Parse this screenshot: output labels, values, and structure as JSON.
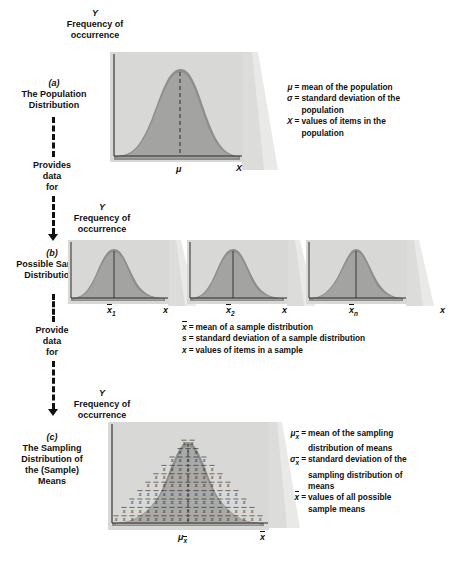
{
  "figure": {
    "background": "#ffffff",
    "panel_fill": "#d8d8d6",
    "curve_band": "#8e8e8c",
    "curve_fill": "#a6a6a4"
  },
  "axis_label": {
    "y_symbol": "Y",
    "y_line1": "Frequency of",
    "y_line2": "occurrence"
  },
  "flow": {
    "step1_line1": "Provides",
    "step1_line2": "data",
    "step1_line3": "for",
    "step2_line1": "Provide",
    "step2_line2": "data",
    "step2_line3": "for"
  },
  "panels": [
    {
      "id": "a",
      "tag": "(a)",
      "caption_lines": [
        "The Population",
        "Distribution"
      ],
      "x_axis_label": "X",
      "center_tick": "μ",
      "curve_type": "right-skewed",
      "center_line_style": "dashed",
      "legend": [
        {
          "symbol": "μ",
          "desc_lines": [
            "mean of the population"
          ]
        },
        {
          "symbol": "σ",
          "desc_lines": [
            "standard deviation of the",
            "population"
          ]
        },
        {
          "symbol": "X",
          "desc_lines": [
            "values of items in the",
            "population"
          ]
        }
      ]
    },
    {
      "id": "b",
      "tag": "(b)",
      "caption_lines": [
        "Possible Sample",
        "Distributions"
      ],
      "x_axis_label": "x",
      "curve_type": "right-skewed",
      "center_line_style": "solid",
      "subcharts": [
        {
          "center_tick": "x",
          "center_sub": "1"
        },
        {
          "center_tick": "x",
          "center_sub": "2"
        },
        {
          "center_tick": "x",
          "center_sub": "n"
        }
      ],
      "legend": [
        {
          "symbol": "x",
          "overline": true,
          "desc_lines": [
            "mean of a sample distribution"
          ]
        },
        {
          "symbol": "s",
          "overline": false,
          "desc_lines": [
            "standard deviation of a sample distribution"
          ]
        },
        {
          "symbol": "x",
          "overline": false,
          "desc_lines": [
            "values of items in a sample"
          ]
        }
      ]
    },
    {
      "id": "c",
      "tag": "(c)",
      "caption_lines": [
        "The Sampling",
        "Distribution of",
        "the (Sample)",
        "Means"
      ],
      "x_axis_label": "x",
      "center_tick": "μ",
      "center_tick_sub": "x",
      "curve_type": "symmetric-normal",
      "fill_marker": "x",
      "marker_rows": [
        19,
        17,
        15,
        13,
        11,
        9,
        7,
        5,
        3,
        2
      ],
      "legend": [
        {
          "symbol": "μ",
          "sub": "x",
          "desc_lines": [
            "mean of the sampling",
            "distribution of means"
          ]
        },
        {
          "symbol": "σ",
          "sub": "x",
          "desc_lines": [
            "standard deviation of the",
            "sampling distribution of",
            "means"
          ]
        },
        {
          "symbol": "x",
          "overline": true,
          "desc_lines": [
            "values of all possible",
            "sample means"
          ]
        }
      ]
    }
  ]
}
